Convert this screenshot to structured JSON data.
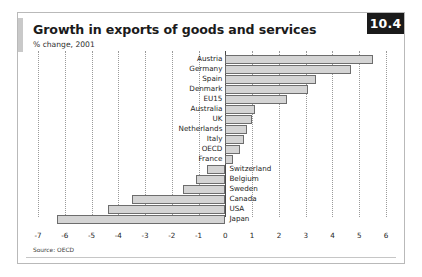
{
  "figure": {
    "number_badge": "10.4",
    "title": "Growth in exports of goods and services",
    "subtitle": "% change, 2001",
    "source": "Source: OECD"
  },
  "chart_data": {
    "type": "bar",
    "orientation": "horizontal",
    "title": "Growth in exports of goods and services",
    "subtitle": "% change, 2001",
    "xlabel": "",
    "ylabel": "",
    "xlim": [
      -7,
      6
    ],
    "xticks": [
      -7,
      -6,
      -5,
      -4,
      -3,
      -2,
      -1,
      0,
      1,
      2,
      3,
      4,
      5,
      6
    ],
    "xtick_labels": [
      "-7",
      "-6",
      "-5",
      "-4",
      "-3",
      "-2",
      "-1",
      "0",
      "1",
      "2",
      "3",
      "4",
      "5",
      "6"
    ],
    "grid": true,
    "legend": null,
    "categories": [
      "Austria",
      "Germany",
      "Spain",
      "Denmark",
      "EU15",
      "Australia",
      "UK",
      "Netherlands",
      "Italy",
      "OECD",
      "France",
      "Switzerland",
      "Belgium",
      "Sweden",
      "Canada",
      "USA",
      "Japan"
    ],
    "values": [
      5.5,
      4.7,
      3.4,
      3.1,
      2.3,
      1.1,
      1.0,
      0.8,
      0.7,
      0.55,
      0.3,
      -0.7,
      -1.1,
      -1.6,
      -3.5,
      -4.4,
      -6.3
    ],
    "source": "Source: OECD"
  }
}
